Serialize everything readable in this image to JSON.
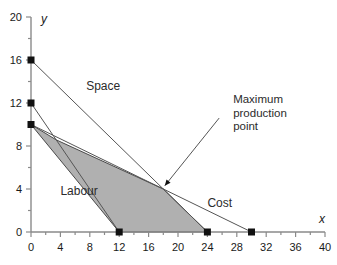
{
  "chart_data": {
    "type": "line",
    "title": "",
    "xlabel": "x",
    "ylabel": "y",
    "xlim": [
      0,
      40
    ],
    "ylim": [
      0,
      20
    ],
    "xticks": [
      0,
      4,
      8,
      12,
      16,
      20,
      24,
      28,
      32,
      36,
      40
    ],
    "yticks": [
      0,
      4,
      8,
      12,
      16,
      20
    ],
    "xtick_labels": [
      "0",
      "4",
      "8",
      "12",
      "16",
      "20",
      "24",
      "28",
      "32",
      "36",
      "40"
    ],
    "ytick_labels": [
      "0",
      "4",
      "8",
      "12",
      "16",
      "20"
    ],
    "minor_tick_step": 2,
    "grid": false,
    "legend": "none",
    "series": [
      {
        "name": "Space",
        "label": "Space",
        "points": [
          [
            0,
            16
          ],
          [
            24,
            0
          ]
        ],
        "markers": [
          [
            0,
            16
          ],
          [
            24,
            0
          ]
        ],
        "label_at": [
          7.5,
          13.2
        ]
      },
      {
        "name": "Labour",
        "label": "Labour",
        "points": [
          [
            0,
            12
          ],
          [
            12,
            0
          ]
        ],
        "markers": [
          [
            0,
            12
          ],
          [
            12,
            0
          ]
        ],
        "label_at": [
          4.0,
          3.4
        ]
      },
      {
        "name": "Cost",
        "label": "Cost",
        "points": [
          [
            0,
            10
          ],
          [
            30,
            0
          ]
        ],
        "markers": [
          [
            0,
            10
          ],
          [
            30,
            0
          ]
        ],
        "label_at": [
          24.0,
          2.3
        ]
      }
    ],
    "shaded_region": {
      "name": "feasible-production-region",
      "fill": "#b0b0b0",
      "vertices": [
        [
          0,
          10
        ],
        [
          3.43,
          8.57
        ],
        [
          18,
          4
        ],
        [
          24,
          0
        ],
        [
          12,
          0
        ]
      ]
    },
    "annotations": [
      {
        "name": "maximum-production-point",
        "lines": [
          "Maximum",
          "production",
          "point"
        ],
        "text_at": [
          27.5,
          12.0
        ],
        "arrow_from": [
          25.6,
          10.6
        ],
        "arrow_to": [
          18.2,
          4.3
        ]
      }
    ],
    "colors": {
      "axis": "#808080",
      "line": "#555555",
      "marker": "#111111",
      "region_fill": "#b0b0b0",
      "region_edge": "#4a4a4a",
      "text": "#1a1a1a",
      "background": "#ffffff"
    }
  }
}
